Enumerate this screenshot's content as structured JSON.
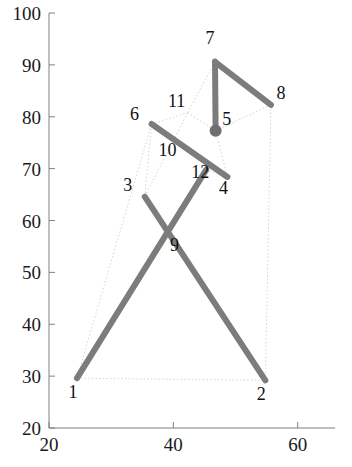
{
  "figure": {
    "type": "skeleton-pose-plot",
    "background": "#ffffff",
    "line_color": "#7c7c7c",
    "faint_color": "#cfcfcf",
    "axis_color": "#808080",
    "text_color": "#1a1a1a"
  },
  "axes": {
    "x": {
      "min": 20,
      "max": 66,
      "ticks": [
        20,
        40,
        60
      ],
      "tick_labels": [
        "20",
        "40",
        "60"
      ],
      "label": ""
    },
    "y": {
      "min": 20,
      "max": 100,
      "ticks": [
        20,
        30,
        40,
        50,
        60,
        70,
        80,
        90,
        100
      ],
      "tick_labels": [
        "20",
        "30",
        "40",
        "50",
        "60",
        "70",
        "80",
        "90",
        "100"
      ],
      "label": ""
    },
    "grid": false
  },
  "chart_data": {
    "type": "scatter",
    "title": "",
    "xlabel": "",
    "ylabel": "",
    "xlim": [
      20,
      66
    ],
    "ylim": [
      20,
      100
    ],
    "grid": false,
    "legend": "none",
    "point_labels": [
      "1",
      "2",
      "3",
      "4",
      "5",
      "6",
      "7",
      "8",
      "9",
      "10",
      "11",
      "12"
    ],
    "nodes": [
      {
        "id": "1",
        "x": 24.5,
        "y": 29.6,
        "label": "1",
        "label_dx": -4,
        "label_dy": -20
      },
      {
        "id": "2",
        "x": 54.8,
        "y": 29.2,
        "label": "2",
        "label_dx": -4,
        "label_dy": -20
      },
      {
        "id": "3",
        "x": 35.4,
        "y": 64.6,
        "label": "3",
        "label_dx": -17,
        "label_dy": 6
      },
      {
        "id": "4",
        "x": 48.7,
        "y": 68.4,
        "label": "4",
        "label_dx": -4,
        "label_dy": -17
      },
      {
        "id": "5",
        "x": 46.8,
        "y": 77.3,
        "label": "5",
        "label_dx": 11,
        "label_dy": 6
      },
      {
        "id": "6",
        "x": 36.5,
        "y": 78.6,
        "label": "6",
        "label_dx": -17,
        "label_dy": 4
      },
      {
        "id": "7",
        "x": 46.7,
        "y": 90.6,
        "label": "7",
        "label_dx": -5,
        "label_dy": 18
      },
      {
        "id": "8",
        "x": 55.7,
        "y": 82.3,
        "label": "8",
        "label_dx": 10,
        "label_dy": 6
      },
      {
        "id": "9",
        "x": 41.0,
        "y": 55.5,
        "label": "9",
        "label_dx": -5,
        "label_dy": -7
      },
      {
        "id": "10",
        "x": 41.0,
        "y": 73.6,
        "label": "10",
        "label_dx": -12,
        "label_dy": -6
      },
      {
        "id": "11",
        "x": 42.3,
        "y": 80.8,
        "label": "11",
        "label_dx": -11,
        "label_dy": 6
      },
      {
        "id": "12",
        "x": 45.3,
        "y": 69.8,
        "label": "12",
        "label_dx": -6,
        "label_dy": -8
      }
    ],
    "limbs": [
      {
        "from": "1",
        "to": "12"
      },
      {
        "from": "2",
        "to": "3"
      },
      {
        "from": "6",
        "to": "4"
      },
      {
        "from": "5",
        "to": "7"
      },
      {
        "from": "7",
        "to": "8"
      }
    ],
    "faint_links": [
      {
        "from": "1",
        "to": "2"
      },
      {
        "from": "1",
        "to": "6"
      },
      {
        "from": "2",
        "to": "8"
      },
      {
        "from": "6",
        "to": "11"
      },
      {
        "from": "11",
        "to": "7"
      },
      {
        "from": "11",
        "to": "5"
      },
      {
        "from": "5",
        "to": "4"
      },
      {
        "from": "5",
        "to": "8"
      },
      {
        "from": "3",
        "to": "11"
      },
      {
        "from": "3",
        "to": "6"
      },
      {
        "from": "12",
        "to": "4"
      }
    ]
  }
}
